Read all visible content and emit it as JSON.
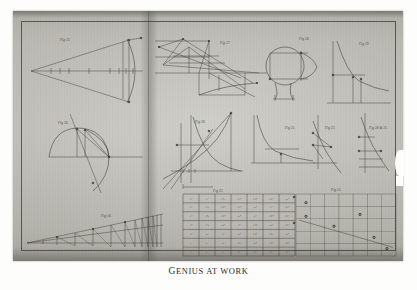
{
  "plate": {
    "caption": "GENIUS AT WORK",
    "caption_first_letters": "G",
    "medium": "engraved plate, two-page spread",
    "paper_color": "#c2c1ba",
    "ink_color": "#3b3934",
    "border_color": "#37352f"
  },
  "figures": [
    {
      "id": "fig-1",
      "label": "Fig 13.",
      "type": "conic-with-chords",
      "description": "Long triangle from left apex to a vertical ordinate at right, with an arc crossing it and tick marks along the horizontal axis."
    },
    {
      "id": "fig-2",
      "label": "Fig 17.",
      "type": "projective-construction",
      "description": "Dense fan of converging lines over a baseline, with a descending curve at lower right."
    },
    {
      "id": "fig-3",
      "label": "Fig 18.",
      "type": "circle-and-square",
      "description": "Circle with inscribed rectangle and an outward curve to the right, plus a pendant shape below."
    },
    {
      "id": "fig-4",
      "label": "Fig 19.",
      "type": "hyperbola",
      "description": "Rectangular hyperbola with two ordinates dropped to the x-axis."
    },
    {
      "id": "fig-5",
      "label": "Fig 16.",
      "type": "semicircle-chords",
      "description": "Semicircle on a horizontal diameter with chords and a secant line crossing it."
    },
    {
      "id": "fig-6",
      "label": "Fig 20.",
      "type": "logarithmic-curve",
      "description": "Rising exponential curve with a falling hyperbola, tangent lines and ordinates."
    },
    {
      "id": "fig-7",
      "label": "Fig 21.",
      "type": "asymptotic-hyperbola",
      "description": "Steep hyperbola hugging the vertical axis and flattening along the horizontal."
    },
    {
      "id": "fig-8",
      "label": "Fig 23.",
      "type": "tangent-construction",
      "description": "Descending curve crossing a vertical axis with tangent and ordinate lines."
    },
    {
      "id": "fig-9",
      "label": "Fig 24 & 25.",
      "type": "tangent-construction",
      "description": "Companion figure: curve with vertical axis, two ordinates and a tangent."
    },
    {
      "id": "fig-10",
      "label": "Fig 14.",
      "type": "limit-wedge",
      "description": "Shallow wedge with vertical ordinates that crowd together toward the right."
    },
    {
      "id": "fig-11",
      "label": "Fig 22.",
      "type": "table",
      "description": "Seven-column table of algebraic powers of x and y."
    },
    {
      "id": "fig-12",
      "label": "Fig 15.",
      "type": "coordinate-grid",
      "description": "Ruled grid with a descending straight line and scattered plotted points."
    }
  ],
  "table": {
    "label": "Fig 22.",
    "columns": 7,
    "rows": [
      [
        "x⁶",
        "y⁶",
        "x⁵y",
        "x⁴y²",
        "x³y³",
        "x²y⁴",
        "xy⁵"
      ],
      [
        "x⁵",
        "x⁴y",
        "x³y²",
        "x²y³",
        "xy⁴",
        "y⁵",
        "x⁴y²"
      ],
      [
        "x⁴",
        "x³y",
        "x²y²",
        "xy³",
        "y⁴",
        "x³y³",
        "x²y⁴"
      ],
      [
        "x³",
        "x²y",
        "xy²",
        "y³",
        "x²y³",
        "xy⁴",
        "x³y²"
      ],
      [
        "x²",
        "xy",
        "y²",
        "xy³",
        "x²y²",
        "x³y",
        "xy⁵"
      ],
      [
        "x",
        "y",
        "xy",
        "x²y",
        "xy²",
        "x²y³",
        "x³y³"
      ],
      [
        "1",
        "x",
        "y",
        "y²",
        "y³",
        "y⁴",
        "y⁵"
      ]
    ]
  },
  "grid": {
    "label": "Fig 15.",
    "cols": 7,
    "rows": 5,
    "points": [
      {
        "x": 0.1,
        "y": 0.14
      },
      {
        "x": 0.1,
        "y": 0.36
      },
      {
        "x": 0.64,
        "y": 0.33
      },
      {
        "x": 0.38,
        "y": 0.52
      },
      {
        "x": 0.78,
        "y": 0.7
      },
      {
        "x": 0.91,
        "y": 0.88
      }
    ],
    "line": {
      "x1": 0.03,
      "y1": 0.42,
      "x2": 0.97,
      "y2": 0.86
    }
  }
}
